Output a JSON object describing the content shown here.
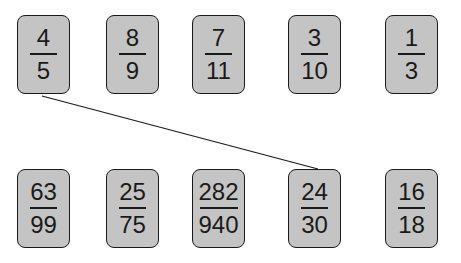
{
  "top_row": [
    {
      "numerator": "4",
      "denominator": "5"
    },
    {
      "numerator": "8",
      "denominator": "9"
    },
    {
      "numerator": "7",
      "denominator": "11"
    },
    {
      "numerator": "3",
      "denominator": "10"
    },
    {
      "numerator": "1",
      "denominator": "3"
    }
  ],
  "bottom_row": [
    {
      "numerator": "63",
      "denominator": "99"
    },
    {
      "numerator": "25",
      "denominator": "75"
    },
    {
      "numerator": "282",
      "denominator": "940"
    },
    {
      "numerator": "24",
      "denominator": "30"
    },
    {
      "numerator": "16",
      "denominator": "18"
    }
  ],
  "connections": [
    {
      "from": "top_row.0",
      "to": "bottom_row.3"
    }
  ],
  "colors": {
    "card_fill": "#c4c4c4",
    "stroke": "#1a1a1a",
    "background": "#ffffff"
  }
}
